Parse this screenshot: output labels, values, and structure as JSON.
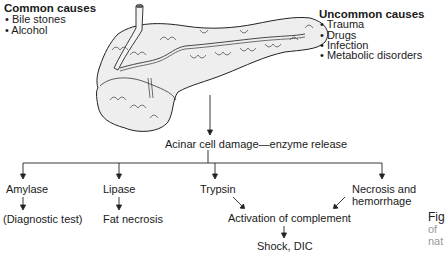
{
  "common_causes": {
    "title": "Common causes",
    "items": [
      "• Bile stones",
      "• Alcohol"
    ]
  },
  "uncommon_causes": {
    "title": "Uncommon causes",
    "items": [
      "• Trauma",
      "• Drugs",
      "• Infection",
      "• Metabolic disorders"
    ]
  },
  "central": {
    "label": "Acinar cell damage—enzyme release"
  },
  "branches": {
    "amylase": "Amylase",
    "amylase_result": "(Diagnostic test)",
    "lipase": "Lipase",
    "lipase_result": "Fat necrosis",
    "trypsin": "Trypsin",
    "necrosis": "Necrosis and",
    "necrosis_2": "hemorrhage",
    "complement": "Activation of complement",
    "shock": "Shock, DIC"
  },
  "caption": {
    "line1": "Fig",
    "line2": "of",
    "line3": "nat"
  },
  "image": {
    "subject": "pancreas-illustration"
  }
}
